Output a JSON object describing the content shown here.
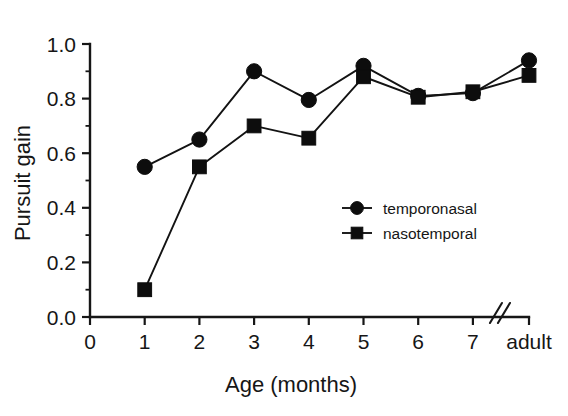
{
  "figure": {
    "background_color": "#ffffff",
    "ink_color": "#161616"
  },
  "chart_data": {
    "type": "line",
    "title": "",
    "xlabel": "Age (months)",
    "ylabel": "Pursuit gain",
    "categories": [
      "1",
      "2",
      "3",
      "4",
      "5",
      "6",
      "7",
      "adult"
    ],
    "x_tick_labels": [
      "0",
      "1",
      "2",
      "3",
      "4",
      "5",
      "6",
      "7",
      "adult"
    ],
    "y_tick_labels": [
      "0.0",
      "0.2",
      "0.4",
      "0.6",
      "0.8",
      "1.0"
    ],
    "y_tick_values": [
      0.0,
      0.2,
      0.4,
      0.6,
      0.8,
      1.0
    ],
    "ylim": [
      0.0,
      1.0
    ],
    "y_minor_tick_values": [
      0.1,
      0.3,
      0.5,
      0.7,
      0.9
    ],
    "grid": false,
    "axis_break": {
      "present": true,
      "symbol": "//",
      "between": [
        "7",
        "adult"
      ]
    },
    "legend": {
      "position": "inside-center-right",
      "entries": [
        {
          "name": "temporonasal",
          "marker": "circle"
        },
        {
          "name": "nasotemporal",
          "marker": "square"
        }
      ]
    },
    "series": [
      {
        "name": "temporonasal",
        "marker": "circle",
        "color": "#0d0d0d",
        "values": [
          0.55,
          0.65,
          0.9,
          0.795,
          0.92,
          0.81,
          0.82,
          0.94
        ]
      },
      {
        "name": "nasotemporal",
        "marker": "square",
        "color": "#0d0d0d",
        "values": [
          0.1,
          0.55,
          0.7,
          0.655,
          0.88,
          0.805,
          0.825,
          0.885
        ]
      }
    ]
  }
}
